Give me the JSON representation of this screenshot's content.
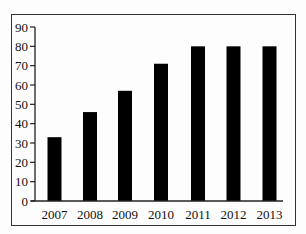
{
  "chart_data": {
    "type": "bar",
    "title": "",
    "xlabel": "",
    "ylabel": "",
    "categories": [
      "2007",
      "2008",
      "2009",
      "2010",
      "2011",
      "2012",
      "2013"
    ],
    "values": [
      33,
      46,
      57,
      71,
      80,
      80,
      80
    ],
    "ylim": [
      0,
      90
    ],
    "yticks": [
      0,
      10,
      20,
      30,
      40,
      50,
      60,
      70,
      80,
      90
    ],
    "grid": false,
    "legend": null,
    "bar_color": "#000000"
  }
}
